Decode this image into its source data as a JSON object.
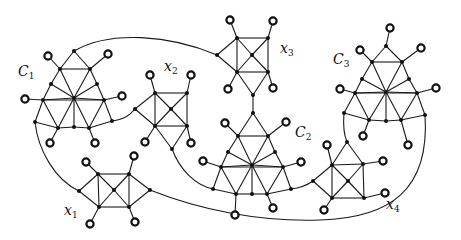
{
  "diagram": {
    "type": "graph",
    "colors": {
      "edge": "#1a1a1a",
      "node": "#111111",
      "pendant_fill": "#ffffff",
      "background": "#ffffff"
    },
    "labels": [
      {
        "id": "C1",
        "base": "C",
        "sub": "1",
        "x": 18,
        "y": 76
      },
      {
        "id": "x2",
        "base": "x",
        "sub": "2",
        "x": 164,
        "y": 71
      },
      {
        "id": "x3",
        "base": "x",
        "sub": "3",
        "x": 280,
        "y": 53
      },
      {
        "id": "C3",
        "base": "C",
        "sub": "3",
        "x": 333,
        "y": 64
      },
      {
        "id": "C2",
        "base": "C",
        "sub": "2",
        "x": 295,
        "y": 137
      },
      {
        "id": "x4",
        "base": "x",
        "sub": "4",
        "x": 386,
        "y": 209
      },
      {
        "id": "x1",
        "base": "x",
        "sub": "1",
        "x": 64,
        "y": 215
      }
    ],
    "components": [
      {
        "name": "C1",
        "nodes": [
          [
            74,
            51
          ],
          [
            60,
            69
          ],
          [
            90,
            69
          ],
          [
            51,
            84
          ],
          [
            97,
            84
          ],
          [
            74,
            98
          ],
          [
            43,
            100
          ],
          [
            104,
            100
          ],
          [
            35,
            122
          ],
          [
            58,
            128
          ],
          [
            74,
            127
          ],
          [
            89,
            128
          ],
          [
            112,
            121
          ]
        ],
        "edges": [
          [
            0,
            1
          ],
          [
            0,
            2
          ],
          [
            1,
            2
          ],
          [
            1,
            3
          ],
          [
            2,
            4
          ],
          [
            3,
            6
          ],
          [
            4,
            7
          ],
          [
            1,
            5
          ],
          [
            2,
            5
          ],
          [
            3,
            5
          ],
          [
            4,
            5
          ],
          [
            6,
            5
          ],
          [
            7,
            5
          ],
          [
            6,
            7
          ],
          [
            6,
            8
          ],
          [
            6,
            9
          ],
          [
            7,
            11
          ],
          [
            7,
            12
          ],
          [
            8,
            9
          ],
          [
            9,
            10
          ],
          [
            10,
            11
          ],
          [
            11,
            12
          ],
          [
            5,
            9
          ],
          [
            5,
            10
          ],
          [
            5,
            11
          ]
        ],
        "pendants": [
          [
            [
              48,
              56
            ],
            1
          ],
          [
            [
              108,
              54
            ],
            2
          ],
          [
            [
              25,
              99
            ],
            6
          ],
          [
            [
              122,
              96
            ],
            7
          ],
          [
            [
              50,
              143
            ],
            9
          ],
          [
            [
              95,
              143
            ],
            11
          ]
        ]
      },
      {
        "name": "x2",
        "nodes": [
          [
            155,
            93
          ],
          [
            187,
            93
          ],
          [
            171,
            109
          ],
          [
            155,
            126
          ],
          [
            187,
            126
          ],
          [
            135,
            109
          ],
          [
            172,
            149
          ]
        ],
        "edges": [
          [
            0,
            1
          ],
          [
            1,
            4
          ],
          [
            4,
            3
          ],
          [
            3,
            0
          ],
          [
            0,
            2
          ],
          [
            1,
            2
          ],
          [
            3,
            2
          ],
          [
            4,
            2
          ],
          [
            5,
            0
          ],
          [
            5,
            3
          ],
          [
            3,
            6
          ],
          [
            4,
            6
          ]
        ],
        "pendants": [
          [
            [
              150,
              75
            ],
            0
          ],
          [
            [
              191,
              75
            ],
            1
          ],
          [
            [
              145,
              142
            ],
            3
          ],
          [
            [
              191,
              143
            ],
            4
          ]
        ]
      },
      {
        "name": "x3",
        "nodes": [
          [
            237,
            38
          ],
          [
            268,
            38
          ],
          [
            252,
            55
          ],
          [
            237,
            72
          ],
          [
            268,
            72
          ],
          [
            217,
            55
          ],
          [
            253,
            95
          ]
        ],
        "edges": [
          [
            0,
            1
          ],
          [
            1,
            4
          ],
          [
            4,
            3
          ],
          [
            3,
            0
          ],
          [
            0,
            2
          ],
          [
            1,
            2
          ],
          [
            3,
            2
          ],
          [
            4,
            2
          ],
          [
            5,
            0
          ],
          [
            5,
            3
          ],
          [
            3,
            6
          ],
          [
            4,
            6
          ]
        ],
        "pendants": [
          [
            [
              230,
              20
            ],
            0
          ],
          [
            [
              273,
              21
            ],
            1
          ],
          [
            [
              228,
              89
            ],
            3
          ],
          [
            [
              273,
              88
            ],
            4
          ]
        ]
      },
      {
        "name": "C2",
        "nodes": [
          [
            253,
            113
          ],
          [
            238,
            136
          ],
          [
            268,
            136
          ],
          [
            228,
            152
          ],
          [
            275,
            152
          ],
          [
            252,
            165
          ],
          [
            221,
            167
          ],
          [
            283,
            167
          ],
          [
            213,
            189
          ],
          [
            236,
            194
          ],
          [
            252,
            194
          ],
          [
            267,
            194
          ],
          [
            291,
            189
          ]
        ],
        "edges": [
          [
            0,
            1
          ],
          [
            0,
            2
          ],
          [
            1,
            2
          ],
          [
            1,
            3
          ],
          [
            2,
            4
          ],
          [
            3,
            6
          ],
          [
            4,
            7
          ],
          [
            1,
            5
          ],
          [
            2,
            5
          ],
          [
            3,
            5
          ],
          [
            4,
            5
          ],
          [
            6,
            5
          ],
          [
            7,
            5
          ],
          [
            6,
            7
          ],
          [
            6,
            8
          ],
          [
            6,
            9
          ],
          [
            7,
            11
          ],
          [
            7,
            12
          ],
          [
            8,
            9
          ],
          [
            9,
            10
          ],
          [
            10,
            11
          ],
          [
            11,
            12
          ],
          [
            5,
            9
          ],
          [
            5,
            10
          ],
          [
            5,
            11
          ]
        ],
        "pendants": [
          [
            [
              225,
              123
            ],
            1
          ],
          [
            [
              286,
              122
            ],
            2
          ],
          [
            [
              203,
              161
            ],
            6
          ],
          [
            [
              301,
              162
            ],
            7
          ],
          [
            [
              235,
              215
            ],
            9
          ],
          [
            [
              273,
              208
            ],
            11
          ]
        ]
      },
      {
        "name": "C3",
        "nodes": [
          [
            386,
            46
          ],
          [
            372,
            62
          ],
          [
            402,
            62
          ],
          [
            362,
            79
          ],
          [
            409,
            79
          ],
          [
            386,
            92
          ],
          [
            355,
            93
          ],
          [
            417,
            93
          ],
          [
            344,
            113
          ],
          [
            369,
            120
          ],
          [
            386,
            121
          ],
          [
            401,
            120
          ],
          [
            425,
            115
          ]
        ],
        "edges": [
          [
            0,
            1
          ],
          [
            0,
            2
          ],
          [
            1,
            2
          ],
          [
            1,
            3
          ],
          [
            2,
            4
          ],
          [
            3,
            6
          ],
          [
            4,
            7
          ],
          [
            1,
            5
          ],
          [
            2,
            5
          ],
          [
            3,
            5
          ],
          [
            4,
            5
          ],
          [
            6,
            5
          ],
          [
            7,
            5
          ],
          [
            6,
            7
          ],
          [
            6,
            8
          ],
          [
            6,
            9
          ],
          [
            7,
            11
          ],
          [
            7,
            12
          ],
          [
            8,
            9
          ],
          [
            9,
            10
          ],
          [
            10,
            11
          ],
          [
            11,
            12
          ],
          [
            5,
            9
          ],
          [
            5,
            10
          ],
          [
            5,
            11
          ]
        ],
        "pendants": [
          [
            [
              390,
              28
            ],
            0
          ],
          [
            [
              360,
              50
            ],
            1
          ],
          [
            [
              421,
              48
            ],
            2
          ],
          [
            [
              340,
              89
            ],
            6
          ],
          [
            [
              436,
              88
            ],
            7
          ],
          [
            [
              363,
              136
            ],
            9
          ],
          [
            [
              408,
              145
            ],
            11
          ]
        ]
      },
      {
        "name": "x4",
        "nodes": [
          [
            332,
            165
          ],
          [
            363,
            164
          ],
          [
            348,
            181
          ],
          [
            332,
            198
          ],
          [
            364,
            198
          ],
          [
            313,
            181
          ],
          [
            347,
            142
          ]
        ],
        "edges": [
          [
            0,
            1
          ],
          [
            1,
            4
          ],
          [
            4,
            3
          ],
          [
            3,
            0
          ],
          [
            0,
            2
          ],
          [
            1,
            2
          ],
          [
            3,
            2
          ],
          [
            4,
            2
          ],
          [
            5,
            0
          ],
          [
            5,
            3
          ],
          [
            6,
            0
          ],
          [
            6,
            1
          ]
        ],
        "pendants": [
          [
            [
              327,
              145
            ],
            0
          ],
          [
            [
              383,
              161
            ],
            1
          ],
          [
            [
              385,
              193
            ],
            4
          ],
          [
            [
              324,
              210
            ],
            3
          ]
        ]
      },
      {
        "name": "x1",
        "nodes": [
          [
            98,
            174
          ],
          [
            129,
            174
          ],
          [
            114,
            190
          ],
          [
            99,
            207
          ],
          [
            129,
            207
          ],
          [
            79,
            191
          ],
          [
            150,
            190
          ]
        ],
        "edges": [
          [
            0,
            1
          ],
          [
            1,
            4
          ],
          [
            4,
            3
          ],
          [
            3,
            0
          ],
          [
            0,
            2
          ],
          [
            1,
            2
          ],
          [
            3,
            2
          ],
          [
            4,
            2
          ],
          [
            5,
            0
          ],
          [
            5,
            3
          ],
          [
            6,
            1
          ],
          [
            6,
            4
          ]
        ],
        "pendants": [
          [
            [
              86,
              162
            ],
            0
          ],
          [
            [
              134,
              156
            ],
            1
          ],
          [
            [
              90,
              224
            ],
            3
          ],
          [
            [
              135,
              222
            ],
            4
          ]
        ]
      }
    ],
    "connectors": [
      {
        "from": "C1.apex",
        "to": "x3.left",
        "path": "M74,51 C110,30 170,35 217,55"
      },
      {
        "from": "C1.bottom-right",
        "to": "x2.left",
        "path": "M112,121 C125,119 130,115 135,109"
      },
      {
        "from": "x3.bottom",
        "to": "C2.apex",
        "path": "M253,95 L253,113"
      },
      {
        "from": "x2.bottom",
        "to": "C2.bottom-left",
        "path": "M172,149 C180,170 195,185 213,189"
      },
      {
        "from": "C2.bottom-right",
        "to": "x4.left",
        "path": "M291,189 C300,188 306,186 313,181"
      },
      {
        "from": "C3.bottom-left",
        "to": "x4.apex",
        "path": "M344,113 C343,125 344,135 347,142"
      },
      {
        "from": "C1.bottom-left",
        "to": "x1.left",
        "path": "M35,122 C38,150 55,180 79,191"
      },
      {
        "from": "x1.right",
        "to": "C3.bottom-right",
        "path": "M150,190 C200,210 260,222 320,220 C390,218 430,190 425,115"
      }
    ]
  }
}
